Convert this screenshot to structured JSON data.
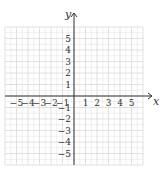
{
  "chart_data": {
    "type": "scatter",
    "title": "",
    "xlabel": "x",
    "ylabel": "y",
    "xlim": [
      -6,
      6
    ],
    "ylim": [
      -6,
      6
    ],
    "grid": true,
    "x_ticks": [
      -5,
      -4,
      -3,
      -2,
      -1,
      1,
      2,
      3,
      4,
      5
    ],
    "y_ticks": [
      5,
      4,
      3,
      2,
      1,
      -1,
      -2,
      -3,
      -4,
      -5
    ],
    "x_tick_labels": [
      "−5",
      "−4",
      "−3",
      "−2",
      "−1",
      "1",
      "2",
      "3",
      "4",
      "5"
    ],
    "y_tick_labels": [
      "5",
      "4",
      "3",
      "2",
      "1",
      "−1",
      "−2",
      "−3",
      "−4",
      "−5"
    ],
    "series": [],
    "legend": null
  },
  "layout": {
    "origin_px": [
      74,
      96
    ],
    "unit_px": 11.5,
    "grid_color": "#d9d9d9",
    "axis_color": "#333333"
  }
}
